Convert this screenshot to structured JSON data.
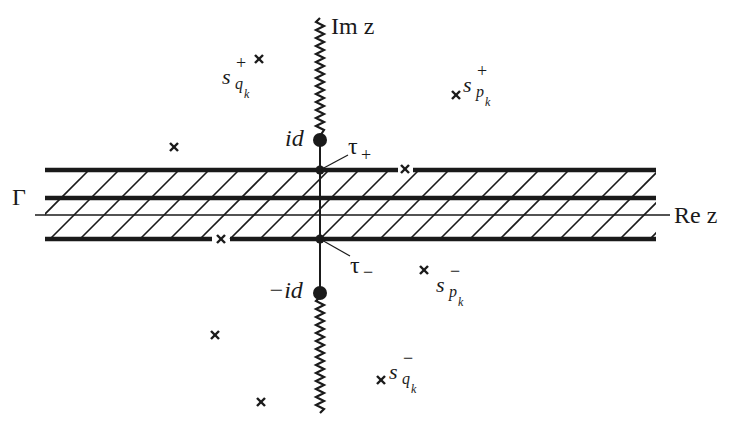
{
  "axes": {
    "imaginary_label": "Im z",
    "real_label": "Re z"
  },
  "points": {
    "upper_branch_point": "id",
    "lower_branch_point": "−id",
    "tau_plus": "τ",
    "tau_plus_sign": "+",
    "tau_minus": "τ",
    "tau_minus_sign": "−"
  },
  "contour": {
    "label": "Γ"
  },
  "singularity_labels": {
    "s_qk_plus": {
      "base": "s",
      "sub": "q",
      "subsub": "k",
      "sign": "+"
    },
    "s_pk_plus": {
      "base": "s",
      "sub": "p",
      "subsub": "k",
      "sign": "+"
    },
    "s_pk_minus": {
      "base": "s",
      "sub": "p",
      "subsub": "k",
      "sign": "−"
    },
    "s_qk_minus": {
      "base": "s",
      "sub": "q",
      "subsub": "k",
      "sign": "−"
    }
  },
  "markers": [
    {
      "x": 259,
      "y": 59
    },
    {
      "x": 456,
      "y": 95
    },
    {
      "x": 174,
      "y": 147
    },
    {
      "x": 405,
      "y": 169
    },
    {
      "x": 221,
      "y": 239
    },
    {
      "x": 424,
      "y": 270
    },
    {
      "x": 215,
      "y": 335
    },
    {
      "x": 381,
      "y": 380
    },
    {
      "x": 261,
      "y": 402
    }
  ],
  "colors": {
    "ink": "#1a1a1a",
    "background": "#ffffff"
  }
}
